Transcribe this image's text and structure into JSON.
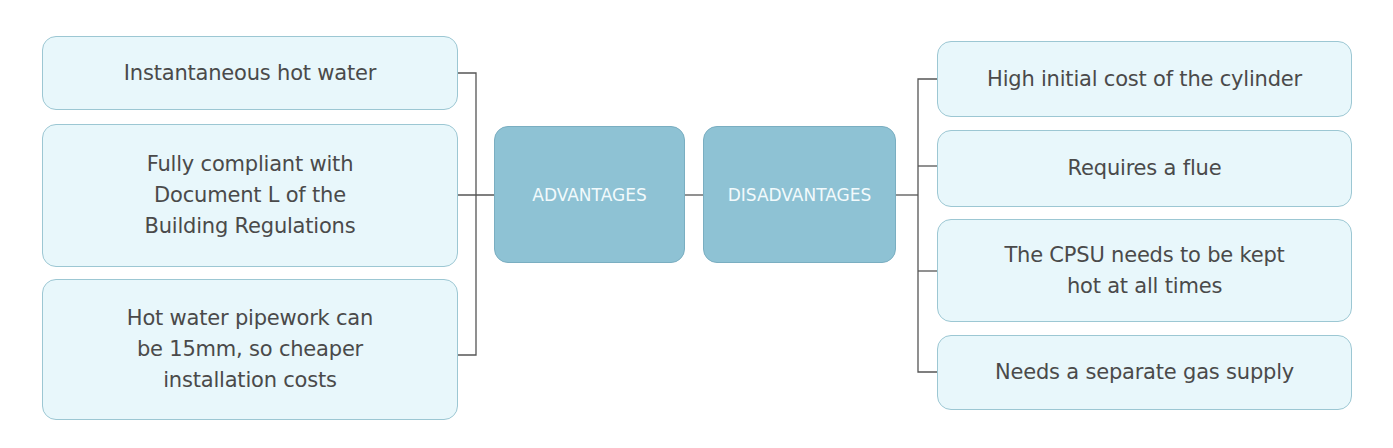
{
  "diagram": {
    "type": "mind-map",
    "colors": {
      "item_fill": "#e8f7fb",
      "item_border": "#9cc7d3",
      "hub_fill": "#8ec2d4",
      "hub_border": "#7aaec1",
      "hub_text": "#f2fafc",
      "item_text": "#4a4a4a",
      "connector": "#555555"
    },
    "advantages": {
      "label": "ADVANTAGES",
      "items": [
        {
          "lines": [
            "Instantaneous hot water"
          ]
        },
        {
          "lines": [
            "Fully compliant with",
            "Document L of the",
            "Building Regulations"
          ]
        },
        {
          "lines": [
            "Hot water pipework can",
            "be 15mm, so cheaper",
            "installation costs"
          ]
        }
      ]
    },
    "disadvantages": {
      "label": "DISADVANTAGES",
      "items": [
        {
          "lines": [
            "High initial cost of the cylinder"
          ]
        },
        {
          "lines": [
            "Requires a flue"
          ]
        },
        {
          "lines": [
            "The CPSU needs to be kept",
            "hot at all times"
          ]
        },
        {
          "lines": [
            "Needs a separate gas supply"
          ]
        }
      ]
    }
  }
}
